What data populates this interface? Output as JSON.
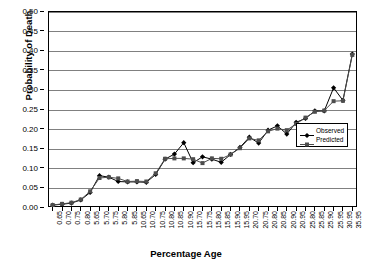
{
  "chart_data": {
    "type": "line",
    "title": "",
    "xlabel": "Percentage Age",
    "ylabel": "Probability of Death",
    "ylim": [
      0.0,
      0.5
    ],
    "ytick_step": 0.05,
    "grid": true,
    "legend_position": "inside-right",
    "ytick_labels": [
      "0.00",
      "0.05",
      "0.10",
      "0.15",
      "0.20",
      "0.25",
      "0.30",
      "0.35",
      "0.40",
      "0.45",
      "0.50"
    ],
    "ytick_values": [
      0.0,
      0.05,
      0.1,
      0.15,
      0.2,
      0.25,
      0.3,
      0.35,
      0.4,
      0.45,
      0.5
    ],
    "categories": [
      "0.65",
      "0.70",
      "0.75",
      "0.80",
      "5.65",
      "5.70",
      "5.75",
      "5.80",
      "5.85",
      "10.65",
      "10.70",
      "10.75",
      "10.80",
      "10.85",
      "10.90",
      "15.70",
      "15.75",
      "15.80",
      "15.85",
      "15.90",
      "15.95",
      "20.70",
      "20.75",
      "20.80",
      "20.85",
      "20.90",
      "20.95",
      "25.80",
      "25.85",
      "25.90",
      "25.95",
      "30.95",
      "35.95"
    ],
    "series": [
      {
        "name": "Observed",
        "marker": "diamond",
        "color": "#000000",
        "values": [
          0.005,
          0.007,
          0.01,
          0.018,
          0.037,
          0.08,
          0.076,
          0.065,
          0.064,
          0.064,
          0.063,
          0.083,
          0.122,
          0.135,
          0.164,
          0.113,
          0.128,
          0.122,
          0.114,
          0.134,
          0.152,
          0.178,
          0.163,
          0.196,
          0.207,
          0.186,
          0.216,
          0.226,
          0.245,
          0.245,
          0.304,
          0.272,
          0.39
        ]
      },
      {
        "name": "Predicted",
        "marker": "square",
        "color": "#4d4d4d",
        "values": [
          0.005,
          0.008,
          0.011,
          0.019,
          0.04,
          0.074,
          0.076,
          0.073,
          0.065,
          0.066,
          0.065,
          0.086,
          0.123,
          0.124,
          0.124,
          0.122,
          0.112,
          0.124,
          0.123,
          0.134,
          0.15,
          0.175,
          0.17,
          0.193,
          0.2,
          0.196,
          0.212,
          0.228,
          0.243,
          0.246,
          0.27,
          0.271,
          0.388
        ]
      }
    ]
  }
}
